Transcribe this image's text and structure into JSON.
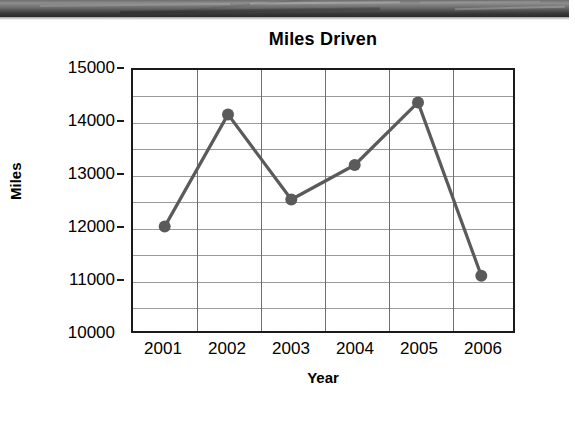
{
  "page": {
    "background_color": "#ffffff",
    "scan_artifact": {
      "name": "scanned-page-top-edge",
      "color": "#3a3a3a"
    }
  },
  "chart_data": {
    "type": "line",
    "title": "Miles Driven",
    "xlabel": "Year",
    "ylabel": "Miles",
    "categories": [
      "2001",
      "2002",
      "2003",
      "2004",
      "2005",
      "2006"
    ],
    "values": [
      12000,
      14150,
      12520,
      13180,
      14380,
      11060
    ],
    "series": [
      {
        "name": "Miles Driven",
        "values": [
          12000,
          14150,
          12520,
          13180,
          14380,
          11060
        ]
      }
    ],
    "ylim": [
      10000,
      15000
    ],
    "ytick_labels": [
      "15000",
      "14000",
      "13000",
      "12000",
      "11000",
      "10000"
    ],
    "ytick_values": [
      15000,
      14000,
      13000,
      12000,
      11000,
      10000
    ],
    "y_gridline_values": [
      14500,
      14000,
      13500,
      13000,
      12500,
      12000,
      11500,
      11000,
      10500
    ],
    "y_minor_step": 500,
    "grid": true,
    "legend": "none",
    "line_color": "#5a5a5a",
    "marker_color": "#5a5a5a",
    "marker_shape": "circle",
    "axis_color": "#1b1b1b",
    "gridline_color": "#9a9a9a"
  },
  "ghost_text": {
    "line1": "",
    "line2": "",
    "line3": ""
  }
}
